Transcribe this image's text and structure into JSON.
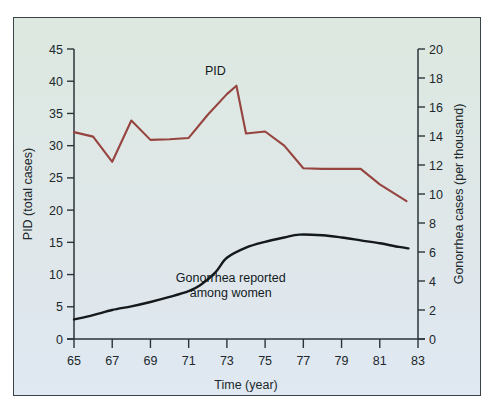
{
  "chart_data": {
    "type": "line",
    "title": "",
    "xlabel": "Time (year)",
    "ylabel": "PID (total cases)",
    "y2label": "Gonorrhea cases (per thousand)",
    "grid": false,
    "legend_position": "inline-annotation",
    "xlim": [
      65,
      83
    ],
    "ylim": [
      0,
      45
    ],
    "y2lim": [
      0,
      20
    ],
    "xticks": [
      65,
      67,
      69,
      71,
      73,
      75,
      77,
      79,
      81,
      83
    ],
    "xtick_labels": [
      "65",
      "67",
      "69",
      "71",
      "73",
      "75",
      "77",
      "79",
      "81",
      "83"
    ],
    "yticks": [
      0,
      5,
      10,
      15,
      20,
      25,
      30,
      35,
      40,
      45
    ],
    "ytick_labels": [
      "0",
      "5",
      "10",
      "15",
      "20",
      "25",
      "30",
      "35",
      "40",
      "45"
    ],
    "y2ticks": [
      0,
      2,
      4,
      6,
      8,
      10,
      12,
      14,
      16,
      18,
      20
    ],
    "y2tick_labels": [
      "0",
      "2",
      "4",
      "6",
      "8",
      "10",
      "12",
      "14",
      "16",
      "18",
      "20"
    ],
    "series": [
      {
        "name": "PID",
        "axis": "left",
        "color": "#96443f",
        "annotation": "PID",
        "annotation_x": 72.4,
        "annotation_y": 41.0,
        "x": [
          65,
          66,
          67,
          68,
          69,
          70,
          71,
          72,
          73,
          73.5,
          74,
          75,
          76,
          77,
          78,
          79,
          80,
          81,
          82.4
        ],
        "values": [
          32.1,
          31.4,
          27.5,
          33.9,
          30.9,
          31.0,
          31.2,
          34.8,
          38.0,
          39.3,
          31.9,
          32.2,
          30.0,
          26.5,
          26.4,
          26.4,
          26.4,
          24.0,
          21.4
        ]
      },
      {
        "name": "Gonorrhea reported among women",
        "axis": "right",
        "color": "#15191c",
        "annotation": "Gonorrhea reported\namong women",
        "annotation_line1": "Gonorrhea reported",
        "annotation_line2": "among women",
        "annotation_x": 73.2,
        "annotation_y": 3.9,
        "x": [
          65,
          66,
          67,
          68,
          69,
          70,
          71,
          71.6,
          72.4,
          73,
          74,
          75,
          76,
          76.8,
          78,
          79,
          80,
          81,
          82,
          82.5
        ],
        "values": [
          1.35,
          1.65,
          2.0,
          2.25,
          2.55,
          2.9,
          3.3,
          3.7,
          4.6,
          5.6,
          6.3,
          6.7,
          7.0,
          7.2,
          7.15,
          7.0,
          6.8,
          6.6,
          6.35,
          6.25
        ]
      }
    ]
  },
  "axes": {
    "left": {
      "title": "PID (total cases)"
    },
    "right": {
      "title": "Gonorrhea cases (per thousand)"
    },
    "bottom": {
      "title": "Time (year)"
    }
  },
  "annotations": {
    "pid": "PID",
    "gonorrhea_line1": "Gonorrhea reported",
    "gonorrhea_line2": "among women"
  }
}
